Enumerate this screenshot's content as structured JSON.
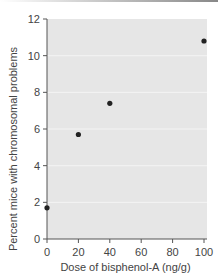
{
  "chart_data": {
    "type": "scatter",
    "title": "",
    "xlabel": "Dose of bisphenol-A (ng/g)",
    "ylabel": "Percent mice with chromosomal problems",
    "x": [
      0,
      20,
      40,
      100
    ],
    "y": [
      1.7,
      5.7,
      7.4,
      10.8
    ],
    "xlim": [
      0,
      100
    ],
    "ylim": [
      0,
      12
    ],
    "xticks": [
      0,
      20,
      40,
      60,
      80,
      100
    ],
    "yticks": [
      0,
      2,
      4,
      6,
      8,
      10,
      12
    ],
    "grid": true,
    "colors": {
      "plot_bg": "#e6e6e6",
      "grid": "#f4f4f4",
      "point": "#222222",
      "axis": "#555555"
    }
  }
}
